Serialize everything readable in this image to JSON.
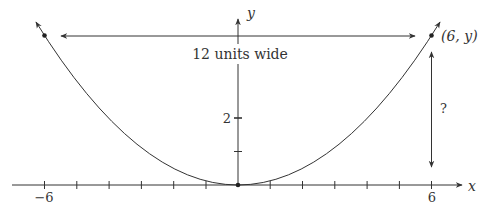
{
  "diagram": {
    "type": "parabola",
    "equation_hint": "y = k x^2 (vertex at origin)",
    "axes": {
      "x_label": "x",
      "y_label": "y",
      "x_ticks": [
        -6,
        -5,
        -4,
        -3,
        -2,
        -1,
        1,
        2,
        3,
        4,
        5,
        6
      ],
      "x_tick_labels": {
        "left": "−6",
        "right": "6"
      },
      "y_ticks": [
        1,
        2
      ],
      "y_tick_label": "2"
    },
    "points": [
      {
        "name": "left-point",
        "x": -6
      },
      {
        "name": "right-point",
        "x": 6,
        "label": "(6, y)"
      },
      {
        "name": "vertex",
        "x": 0,
        "y": 0
      }
    ],
    "annotations": {
      "width_label": "12 units wide",
      "height_label": "?"
    },
    "colors": {
      "stroke": "#333333",
      "text": "#333333",
      "background": "#ffffff"
    }
  }
}
